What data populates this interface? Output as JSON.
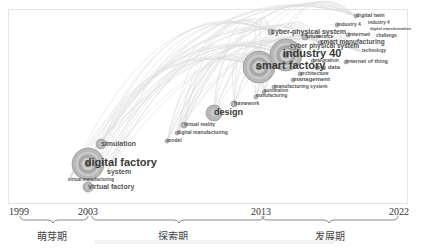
{
  "chart_data": {
    "type": "timeline-keyword-cluster",
    "title": "",
    "x_axis": {
      "ticks": [
        "1999",
        "2003",
        "2013",
        "2022"
      ]
    },
    "stages": [
      {
        "label": "萌芽期",
        "from": "1999",
        "to": "2003"
      },
      {
        "label": "探索期",
        "from": "2003",
        "to": "2013"
      },
      {
        "label": "发展期",
        "from": "2013",
        "to": "2022"
      }
    ],
    "keywords": [
      {
        "term": "digital factory",
        "x": 88,
        "y": 164,
        "r": 16,
        "size": 11
      },
      {
        "term": "system",
        "x": 107,
        "y": 172,
        "r": 0,
        "size": 7
      },
      {
        "term": "simulation",
        "x": 101,
        "y": 144,
        "r": 5,
        "size": 7
      },
      {
        "term": "virtual manufacturing",
        "x": 68,
        "y": 181,
        "r": 0,
        "size": 4.5
      },
      {
        "term": "virtual factory",
        "x": 88,
        "y": 187,
        "r": 5,
        "size": 7
      },
      {
        "term": "model",
        "x": 167,
        "y": 141,
        "r": 2,
        "size": 5
      },
      {
        "term": "digital manufacturing",
        "x": 177,
        "y": 133,
        "r": 2,
        "size": 5
      },
      {
        "term": "virtual reality",
        "x": 184,
        "y": 125,
        "r": 3,
        "size": 5
      },
      {
        "term": "design",
        "x": 214,
        "y": 113,
        "r": 8,
        "size": 9
      },
      {
        "term": "framework",
        "x": 234,
        "y": 104,
        "r": 3,
        "size": 5
      },
      {
        "term": "manufacturing",
        "x": 256,
        "y": 97,
        "r": 2,
        "size": 4.5
      },
      {
        "term": "automation",
        "x": 264,
        "y": 92,
        "r": 2,
        "size": 4.5
      },
      {
        "term": "manufacturing system",
        "x": 274,
        "y": 87,
        "r": 2,
        "size": 5
      },
      {
        "term": "management",
        "x": 293,
        "y": 80,
        "r": 2,
        "size": 6
      },
      {
        "term": "architecture",
        "x": 300,
        "y": 74,
        "r": 2,
        "size": 5
      },
      {
        "term": "big data",
        "x": 317,
        "y": 68,
        "r": 2,
        "size": 6
      },
      {
        "term": "smart factory",
        "x": 259,
        "y": 67,
        "r": 16,
        "size": 11
      },
      {
        "term": "industry 40",
        "x": 286,
        "y": 55,
        "r": 16,
        "size": 11
      },
      {
        "term": "integration",
        "x": 313,
        "y": 61,
        "r": 2,
        "size": 5
      },
      {
        "term": "internet of thing",
        "x": 346,
        "y": 62,
        "r": 2,
        "size": 5.5
      },
      {
        "term": "cyber physical system",
        "x": 290,
        "y": 47,
        "r": 2,
        "size": 6.5
      },
      {
        "term": "smart manufacturing",
        "x": 320,
        "y": 43,
        "r": 2,
        "size": 6.5
      },
      {
        "term": "cyber-physical system",
        "x": 271,
        "y": 32,
        "r": 3,
        "size": 7
      },
      {
        "term": "future",
        "x": 305,
        "y": 37,
        "r": 3,
        "size": 5.5
      },
      {
        "term": "service",
        "x": 316,
        "y": 37,
        "r": 0,
        "size": 5
      },
      {
        "term": "internet",
        "x": 348,
        "y": 35,
        "r": 2,
        "size": 6
      },
      {
        "term": "challenge",
        "x": 376,
        "y": 37,
        "r": 0,
        "size": 4.5
      },
      {
        "term": "technology",
        "x": 362,
        "y": 52,
        "r": 0,
        "size": 4.5
      },
      {
        "term": "industry 4",
        "x": 337,
        "y": 25,
        "r": 2,
        "size": 5
      },
      {
        "term": "industry 4",
        "x": 368,
        "y": 24,
        "r": 0,
        "size": 4.5
      },
      {
        "term": "digital transformation",
        "x": 370,
        "y": 29,
        "r": 0,
        "size": 4
      },
      {
        "term": "digital twin",
        "x": 356,
        "y": 16,
        "r": 2,
        "size": 5.5
      }
    ]
  },
  "axis": {
    "y1999": "1999",
    "y2003": "2003",
    "y2013": "2013",
    "y2022": "2022"
  },
  "stage_labels": {
    "s1": "萌芽期",
    "s2": "探索期",
    "s3": "发展期"
  }
}
